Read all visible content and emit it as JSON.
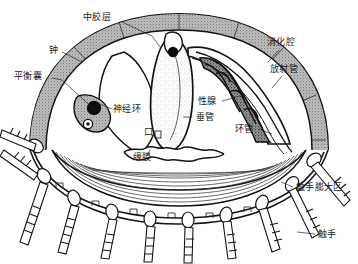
{
  "figure": {
    "type": "anatomical-cross-section",
    "organism": "水螅水母",
    "background_color": "#ffffff",
    "ink_color": "#1b1b1b",
    "mesoglea_fill": "#b9b9b9",
    "body_fill": "#ffffff",
    "stipple_color": "#6e6e6e"
  },
  "labels": [
    {
      "id": "mesoglea",
      "text": "中胶层",
      "x": 83,
      "y": 20,
      "leader": "M 122,22 L 152,36 L 160,47",
      "anchor": "start"
    },
    {
      "id": "bell",
      "text": "钟",
      "x": 49,
      "y": 53,
      "leader": "M 62,52 L 82,62",
      "anchor": "start"
    },
    {
      "id": "statocyst",
      "text": "平衡囊",
      "x": 14,
      "y": 79,
      "leader": "M 52,78 L 62,80 L 96,111",
      "anchor": "start"
    },
    {
      "id": "nerve-ring",
      "text": "神经环",
      "x": 113,
      "y": 112,
      "leader": "M 112,109 L 100,104",
      "anchor": "start"
    },
    {
      "id": "gastric-cavity",
      "text": "消化腔",
      "x": 267,
      "y": 45,
      "leader": "M 279,50 L 268,62",
      "anchor": "start"
    },
    {
      "id": "radial-canal",
      "text": "放射管",
      "x": 270,
      "y": 72,
      "leader": "M 282,76 L 272,88",
      "anchor": "start"
    },
    {
      "id": "gonad",
      "text": "性腺",
      "x": 198,
      "y": 104,
      "leader": "M 222,101 L 240,96",
      "anchor": "start"
    },
    {
      "id": "manubrium",
      "text": "垂管",
      "x": 196,
      "y": 120,
      "leader": "M 192,117 L 183,117",
      "anchor": "start"
    },
    {
      "id": "mouth",
      "text": "口",
      "x": 144,
      "y": 135,
      "leader": "",
      "anchor": "start"
    },
    {
      "id": "ring-canal",
      "text": "环管",
      "x": 235,
      "y": 132,
      "leader": "M 259,129 L 272,134",
      "anchor": "start"
    },
    {
      "id": "velum",
      "text": "缘膜",
      "x": 133,
      "y": 160,
      "leader": "M 147,156 L 150,150",
      "anchor": "start"
    },
    {
      "id": "tentacle-bulb-zone",
      "text": "触手膨大区",
      "x": 296,
      "y": 190,
      "leader": "M 293,187 L 281,182",
      "anchor": "start"
    },
    {
      "id": "tentacle",
      "text": "触手",
      "x": 318,
      "y": 237,
      "leader": "M 315,234 L 297,232",
      "anchor": "start"
    }
  ],
  "structures": [
    {
      "id": "bell-outer-wall",
      "name": "钟形外壁"
    },
    {
      "id": "mesoglea-layer",
      "name": "中胶层"
    },
    {
      "id": "gastric-cavity-region",
      "name": "消化腔"
    },
    {
      "id": "radial-canal-line",
      "name": "放射管"
    },
    {
      "id": "ring-canal-line",
      "name": "环管"
    },
    {
      "id": "gonad-folded",
      "name": "性腺"
    },
    {
      "id": "manubrium-stalk",
      "name": "垂管"
    },
    {
      "id": "mouth-opening",
      "name": "口"
    },
    {
      "id": "velum-membrane",
      "name": "缘膜"
    },
    {
      "id": "nerve-ring-node",
      "name": "神经环"
    },
    {
      "id": "statocyst-node",
      "name": "平衡囊"
    },
    {
      "id": "tentacle-bulbs",
      "name": "触手膨大区"
    },
    {
      "id": "tentacles",
      "name": "触手",
      "count": 13
    }
  ]
}
